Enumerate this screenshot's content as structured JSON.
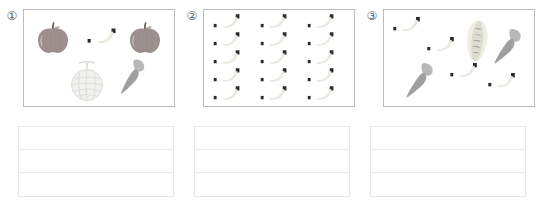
{
  "worksheet": {
    "panels": [
      {
        "index_label": "①",
        "index_name": "panel-1",
        "items": [
          {
            "kind": "apple",
            "label": "apple",
            "x": 12,
            "y": 12,
            "scale": 1.0,
            "rot": 0
          },
          {
            "kind": "apple",
            "label": "apple",
            "x": 104,
            "y": 12,
            "scale": 1.0,
            "rot": 0
          },
          {
            "kind": "banana",
            "label": "banana",
            "x": 63,
            "y": 18,
            "scale": 1.0,
            "rot": 0
          },
          {
            "kind": "melon",
            "label": "melon",
            "x": 44,
            "y": 50,
            "scale": 1.0,
            "rot": 0
          },
          {
            "kind": "carrot",
            "label": "carrot",
            "x": 95,
            "y": 48,
            "scale": 1.0,
            "rot": 18
          }
        ],
        "counts": {
          "apple": 2,
          "banana": 1,
          "melon": 1,
          "carrot": 1
        }
      },
      {
        "index_label": "②",
        "index_name": "panel-2",
        "items": [
          {
            "kind": "banana",
            "label": "banana",
            "x": 8,
            "y": 3,
            "scale": 0.92,
            "rot": 0
          },
          {
            "kind": "banana",
            "label": "banana",
            "x": 55,
            "y": 3,
            "scale": 0.92,
            "rot": 0
          },
          {
            "kind": "banana",
            "label": "banana",
            "x": 102,
            "y": 3,
            "scale": 0.92,
            "rot": 0
          },
          {
            "kind": "banana",
            "label": "banana",
            "x": 8,
            "y": 21,
            "scale": 0.92,
            "rot": 0
          },
          {
            "kind": "banana",
            "label": "banana",
            "x": 55,
            "y": 21,
            "scale": 0.92,
            "rot": 0
          },
          {
            "kind": "banana",
            "label": "banana",
            "x": 102,
            "y": 21,
            "scale": 0.92,
            "rot": 0
          },
          {
            "kind": "banana",
            "label": "banana",
            "x": 8,
            "y": 39,
            "scale": 0.92,
            "rot": 0
          },
          {
            "kind": "banana",
            "label": "banana",
            "x": 55,
            "y": 39,
            "scale": 0.92,
            "rot": 0
          },
          {
            "kind": "banana",
            "label": "banana",
            "x": 102,
            "y": 39,
            "scale": 0.92,
            "rot": 0
          },
          {
            "kind": "banana",
            "label": "banana",
            "x": 8,
            "y": 57,
            "scale": 0.92,
            "rot": 0
          },
          {
            "kind": "banana",
            "label": "banana",
            "x": 55,
            "y": 57,
            "scale": 0.92,
            "rot": 0
          },
          {
            "kind": "banana",
            "label": "banana",
            "x": 102,
            "y": 57,
            "scale": 0.92,
            "rot": 0
          },
          {
            "kind": "banana",
            "label": "banana",
            "x": 8,
            "y": 75,
            "scale": 0.92,
            "rot": 0
          },
          {
            "kind": "banana",
            "label": "banana",
            "x": 55,
            "y": 75,
            "scale": 0.92,
            "rot": 0
          },
          {
            "kind": "banana",
            "label": "banana",
            "x": 102,
            "y": 75,
            "scale": 0.92,
            "rot": 0
          }
        ],
        "counts": {
          "banana": 15
        }
      },
      {
        "index_label": "③",
        "index_name": "panel-3",
        "items": [
          {
            "kind": "banana",
            "label": "banana",
            "x": 8,
            "y": 6,
            "scale": 0.95,
            "rot": 0
          },
          {
            "kind": "banana",
            "label": "banana",
            "x": 42,
            "y": 26,
            "scale": 0.95,
            "rot": 0
          },
          {
            "kind": "banana",
            "label": "banana",
            "x": 65,
            "y": 52,
            "scale": 0.95,
            "rot": 0
          },
          {
            "kind": "banana",
            "label": "banana",
            "x": 103,
            "y": 62,
            "scale": 0.95,
            "rot": 0
          },
          {
            "kind": "corn",
            "label": "corn",
            "x": 78,
            "y": 7,
            "scale": 1.0,
            "rot": 6
          },
          {
            "kind": "carrot",
            "label": "carrot",
            "x": 110,
            "y": 18,
            "scale": 1.05,
            "rot": 22
          },
          {
            "kind": "carrot",
            "label": "carrot",
            "x": 22,
            "y": 52,
            "scale": 1.05,
            "rot": 22
          }
        ],
        "counts": {
          "banana": 4,
          "corn": 1,
          "carrot": 2
        }
      }
    ],
    "answer_boxes": [
      {
        "name": "answer-box-1",
        "rows": [
          "",
          "",
          ""
        ]
      },
      {
        "name": "answer-box-2",
        "rows": [
          "",
          "",
          ""
        ]
      },
      {
        "name": "answer-box-3",
        "rows": [
          "",
          "",
          ""
        ]
      }
    ],
    "colors": {
      "apple_body": "#9e8f8f",
      "apple_stem": "#6e6257",
      "banana_body": "#f3f1ea",
      "banana_stem": "#2a2a2a",
      "melon_body": "#f0f0ee",
      "melon_net": "#dcdcd6",
      "carrot_body": "#a0a0a0",
      "carrot_top": "#b8b8b8",
      "corn_husk": "#efeee4",
      "corn_kernels": "#dedcd0",
      "panel_border": "#b9b9b9",
      "answer_border": "#e6e6e6",
      "answer_rule": "#ebebeb",
      "index_text": "#5d5d5d"
    }
  }
}
